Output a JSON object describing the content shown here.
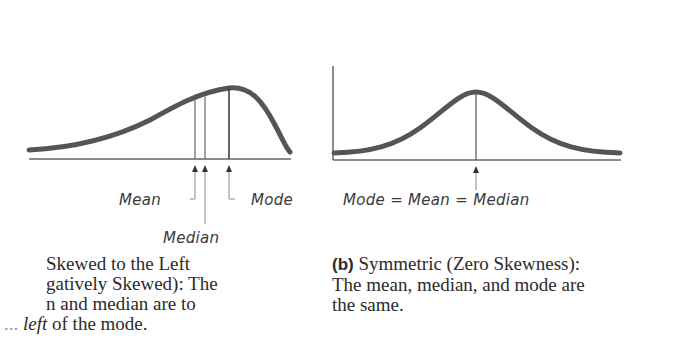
{
  "colors": {
    "curve": "#555555",
    "axis": "#666666",
    "marker": "#333333",
    "text": "#2b2b2b"
  },
  "panel_a": {
    "labels": {
      "mean": "Mean",
      "median": "Median",
      "mode": "Mode"
    },
    "caption": {
      "line1": "Skewed to the Left",
      "line2": "gatively Skewed): The",
      "line3": "n and median are to",
      "line4_prefix": "...",
      "line4_italic": "left",
      "line4_rest": " of the mode."
    }
  },
  "panel_b": {
    "label": "Mode = Mean = Median",
    "caption": {
      "tag": "(b)",
      "line1": " Symmetric (Zero Skewness):",
      "line2": "The mean, median, and mode are",
      "line3": "the same."
    }
  }
}
